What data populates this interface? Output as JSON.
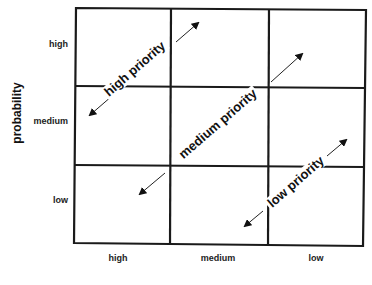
{
  "diagram": {
    "type": "risk-priority-matrix",
    "y_axis": {
      "title": "probability",
      "labels": [
        "high",
        "medium",
        "low"
      ]
    },
    "x_axis": {
      "title": "",
      "labels": [
        "high",
        "medium",
        "low"
      ]
    },
    "grid": {
      "rows": 3,
      "columns": 3,
      "line_color": "#1a1a1a"
    },
    "priority_bands": [
      {
        "label": "high priority",
        "direction": "diagonal-bidirectional"
      },
      {
        "label": "medium priority",
        "direction": "diagonal-bidirectional"
      },
      {
        "label": "low priority",
        "direction": "diagonal-bidirectional"
      }
    ]
  }
}
